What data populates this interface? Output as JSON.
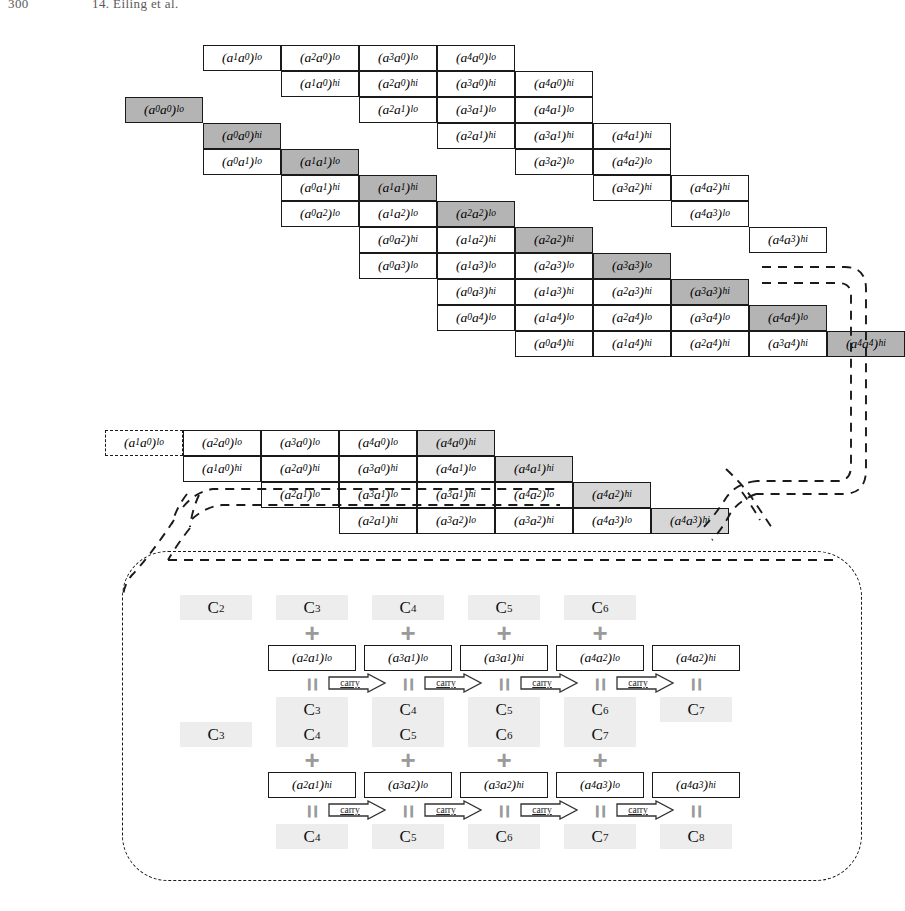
{
  "runhead": {
    "folio": "300",
    "chapter": "14. Eiling et al."
  },
  "labels": {
    "carry": "carry",
    "plus": "+",
    "equals": "="
  },
  "colors": {
    "shade_dark": "#b4b4b4",
    "shade_light": "#d6d6d6",
    "carry_slot": "#ededed",
    "line": "#1a1a1a",
    "operator_grey": "#9a9a9a"
  },
  "geometry": {
    "cell_w": 78,
    "cell_h": 26,
    "grid_origin_x": 125,
    "grid_origin_y": 45,
    "mid_origin_x": 105,
    "mid_origin_y": 430
  },
  "main_grid": {
    "caption": "Partial product staircase for a 5-limb squaring",
    "rows": [
      {
        "row": 0,
        "col": 1,
        "cells": [
          {
            "a": "1",
            "b": "0",
            "half": "lo",
            "shade": "none"
          },
          {
            "a": "2",
            "b": "0",
            "half": "lo",
            "shade": "none"
          },
          {
            "a": "3",
            "b": "0",
            "half": "lo",
            "shade": "none"
          },
          {
            "a": "4",
            "b": "0",
            "half": "lo",
            "shade": "none"
          }
        ]
      },
      {
        "row": 1,
        "col": 2,
        "cells": [
          {
            "a": "1",
            "b": "0",
            "half": "hi",
            "shade": "none"
          },
          {
            "a": "2",
            "b": "0",
            "half": "hi",
            "shade": "none"
          },
          {
            "a": "3",
            "b": "0",
            "half": "hi",
            "shade": "none"
          },
          {
            "a": "4",
            "b": "0",
            "half": "hi",
            "shade": "none"
          }
        ]
      },
      {
        "row": 2,
        "col": 0,
        "cells": [
          {
            "a": "0",
            "b": "0",
            "half": "lo",
            "shade": "dark"
          }
        ]
      },
      {
        "row": 2,
        "col": 3,
        "cells": [
          {
            "a": "2",
            "b": "1",
            "half": "lo",
            "shade": "none"
          },
          {
            "a": "3",
            "b": "1",
            "half": "lo",
            "shade": "none"
          },
          {
            "a": "4",
            "b": "1",
            "half": "lo",
            "shade": "none"
          }
        ]
      },
      {
        "row": 3,
        "col": 1,
        "cells": [
          {
            "a": "0",
            "b": "0",
            "half": "hi",
            "shade": "dark"
          }
        ]
      },
      {
        "row": 3,
        "col": 4,
        "cells": [
          {
            "a": "2",
            "b": "1",
            "half": "hi",
            "shade": "none"
          },
          {
            "a": "3",
            "b": "1",
            "half": "hi",
            "shade": "none"
          },
          {
            "a": "4",
            "b": "1",
            "half": "hi",
            "shade": "none"
          }
        ]
      },
      {
        "row": 4,
        "col": 1,
        "cells": [
          {
            "a": "0",
            "b": "1",
            "half": "lo",
            "shade": "none"
          },
          {
            "a": "1",
            "b": "1",
            "half": "lo",
            "shade": "dark"
          }
        ]
      },
      {
        "row": 4,
        "col": 5,
        "cells": [
          {
            "a": "3",
            "b": "2",
            "half": "lo",
            "shade": "none"
          },
          {
            "a": "4",
            "b": "2",
            "half": "lo",
            "shade": "none"
          }
        ]
      },
      {
        "row": 5,
        "col": 2,
        "cells": [
          {
            "a": "0",
            "b": "1",
            "half": "hi",
            "shade": "none"
          },
          {
            "a": "1",
            "b": "1",
            "half": "hi",
            "shade": "dark"
          }
        ]
      },
      {
        "row": 5,
        "col": 6,
        "cells": [
          {
            "a": "3",
            "b": "2",
            "half": "hi",
            "shade": "none"
          },
          {
            "a": "4",
            "b": "2",
            "half": "hi",
            "shade": "none"
          }
        ]
      },
      {
        "row": 6,
        "col": 2,
        "cells": [
          {
            "a": "0",
            "b": "2",
            "half": "lo",
            "shade": "none"
          },
          {
            "a": "1",
            "b": "2",
            "half": "lo",
            "shade": "none"
          },
          {
            "a": "2",
            "b": "2",
            "half": "lo",
            "shade": "dark"
          }
        ]
      },
      {
        "row": 6,
        "col": 7,
        "cells": [
          {
            "a": "4",
            "b": "3",
            "half": "lo",
            "shade": "none"
          }
        ]
      },
      {
        "row": 7,
        "col": 3,
        "cells": [
          {
            "a": "0",
            "b": "2",
            "half": "hi",
            "shade": "none"
          },
          {
            "a": "1",
            "b": "2",
            "half": "hi",
            "shade": "none"
          },
          {
            "a": "2",
            "b": "2",
            "half": "hi",
            "shade": "dark"
          }
        ]
      },
      {
        "row": 7,
        "col": 8,
        "cells": [
          {
            "a": "4",
            "b": "3",
            "half": "hi",
            "shade": "none"
          }
        ]
      },
      {
        "row": 8,
        "col": 3,
        "cells": [
          {
            "a": "0",
            "b": "3",
            "half": "lo",
            "shade": "none"
          },
          {
            "a": "1",
            "b": "3",
            "half": "lo",
            "shade": "none"
          },
          {
            "a": "2",
            "b": "3",
            "half": "lo",
            "shade": "none"
          },
          {
            "a": "3",
            "b": "3",
            "half": "lo",
            "shade": "dark"
          }
        ]
      },
      {
        "row": 9,
        "col": 4,
        "cells": [
          {
            "a": "0",
            "b": "3",
            "half": "hi",
            "shade": "none"
          },
          {
            "a": "1",
            "b": "3",
            "half": "hi",
            "shade": "none"
          },
          {
            "a": "2",
            "b": "3",
            "half": "hi",
            "shade": "none"
          },
          {
            "a": "3",
            "b": "3",
            "half": "hi",
            "shade": "dark"
          }
        ]
      },
      {
        "row": 10,
        "col": 4,
        "cells": [
          {
            "a": "0",
            "b": "4",
            "half": "lo",
            "shade": "none"
          },
          {
            "a": "1",
            "b": "4",
            "half": "lo",
            "shade": "none"
          },
          {
            "a": "2",
            "b": "4",
            "half": "lo",
            "shade": "none"
          },
          {
            "a": "3",
            "b": "4",
            "half": "lo",
            "shade": "none"
          },
          {
            "a": "4",
            "b": "4",
            "half": "lo",
            "shade": "dark"
          }
        ]
      },
      {
        "row": 11,
        "col": 5,
        "cells": [
          {
            "a": "0",
            "b": "4",
            "half": "hi",
            "shade": "none"
          },
          {
            "a": "1",
            "b": "4",
            "half": "hi",
            "shade": "none"
          },
          {
            "a": "2",
            "b": "4",
            "half": "hi",
            "shade": "none"
          },
          {
            "a": "3",
            "b": "4",
            "half": "hi",
            "shade": "none"
          },
          {
            "a": "4",
            "b": "4",
            "half": "hi",
            "shade": "dark"
          }
        ]
      }
    ]
  },
  "mid_grid": {
    "caption": "Folded / compressed accumulation rows",
    "rows": [
      {
        "row": 0,
        "col": 0,
        "cells": [
          {
            "a": "1",
            "b": "0",
            "half": "lo",
            "shade": "dashed"
          },
          {
            "a": "2",
            "b": "0",
            "half": "lo",
            "shade": "none"
          },
          {
            "a": "3",
            "b": "0",
            "half": "lo",
            "shade": "none"
          },
          {
            "a": "4",
            "b": "0",
            "half": "lo",
            "shade": "none"
          },
          {
            "a": "4",
            "b": "0",
            "half": "hi",
            "shade": "light"
          }
        ]
      },
      {
        "row": 1,
        "col": 1,
        "cells": [
          {
            "a": "1",
            "b": "0",
            "half": "hi",
            "shade": "none"
          },
          {
            "a": "2",
            "b": "0",
            "half": "hi",
            "shade": "none"
          },
          {
            "a": "3",
            "b": "0",
            "half": "hi",
            "shade": "none"
          },
          {
            "a": "4",
            "b": "1",
            "half": "lo",
            "shade": "none"
          },
          {
            "a": "4",
            "b": "1",
            "half": "hi",
            "shade": "light"
          }
        ]
      },
      {
        "row": 2,
        "col": 2,
        "cells": [
          {
            "a": "2",
            "b": "1",
            "half": "lo",
            "shade": "none"
          },
          {
            "a": "3",
            "b": "1",
            "half": "lo",
            "shade": "none"
          },
          {
            "a": "3",
            "b": "1",
            "half": "hi",
            "shade": "none"
          },
          {
            "a": "4",
            "b": "2",
            "half": "lo",
            "shade": "none"
          },
          {
            "a": "4",
            "b": "2",
            "half": "hi",
            "shade": "light"
          }
        ]
      },
      {
        "row": 3,
        "col": 3,
        "cells": [
          {
            "a": "2",
            "b": "1",
            "half": "hi",
            "shade": "none"
          },
          {
            "a": "3",
            "b": "2",
            "half": "lo",
            "shade": "none"
          },
          {
            "a": "3",
            "b": "2",
            "half": "hi",
            "shade": "none"
          },
          {
            "a": "4",
            "b": "3",
            "half": "lo",
            "shade": "none"
          },
          {
            "a": "4",
            "b": "3",
            "half": "hi",
            "shade": "light"
          }
        ]
      }
    ]
  },
  "carry_panel": {
    "caption": "Carry propagation detail for the two accumulation rows",
    "chains": [
      {
        "id": "chain-1",
        "inputs": [
          "C2",
          "C3",
          "C4",
          "C5",
          "C6"
        ],
        "input_subs": [
          "2",
          "3",
          "4",
          "5",
          "6"
        ],
        "outputs": [
          "C3",
          "C4",
          "C5",
          "C6",
          "C7"
        ],
        "output_subs": [
          "3",
          "4",
          "5",
          "6",
          "7"
        ],
        "terms": [
          {
            "a": "2",
            "b": "1",
            "half": "lo"
          },
          {
            "a": "3",
            "b": "1",
            "half": "lo"
          },
          {
            "a": "3",
            "b": "1",
            "half": "hi"
          },
          {
            "a": "4",
            "b": "2",
            "half": "lo"
          },
          {
            "a": "4",
            "b": "2",
            "half": "hi"
          }
        ],
        "term_start_slot": 1,
        "plus_slots": [
          1,
          2,
          3,
          4
        ],
        "carry_count": 4
      },
      {
        "id": "chain-2",
        "inputs": [
          "C3",
          "C4",
          "C5",
          "C6",
          "C7"
        ],
        "input_subs": [
          "3",
          "4",
          "5",
          "6",
          "7"
        ],
        "outputs": [
          "C4",
          "C5",
          "C6",
          "C7",
          "C8"
        ],
        "output_subs": [
          "4",
          "5",
          "6",
          "7",
          "8"
        ],
        "terms": [
          {
            "a": "2",
            "b": "1",
            "half": "hi"
          },
          {
            "a": "3",
            "b": "2",
            "half": "lo"
          },
          {
            "a": "3",
            "b": "2",
            "half": "hi"
          },
          {
            "a": "4",
            "b": "3",
            "half": "lo"
          },
          {
            "a": "4",
            "b": "3",
            "half": "hi"
          }
        ],
        "term_start_slot": 1,
        "plus_slots": [
          1,
          2,
          3,
          4
        ],
        "carry_count": 4
      }
    ]
  }
}
